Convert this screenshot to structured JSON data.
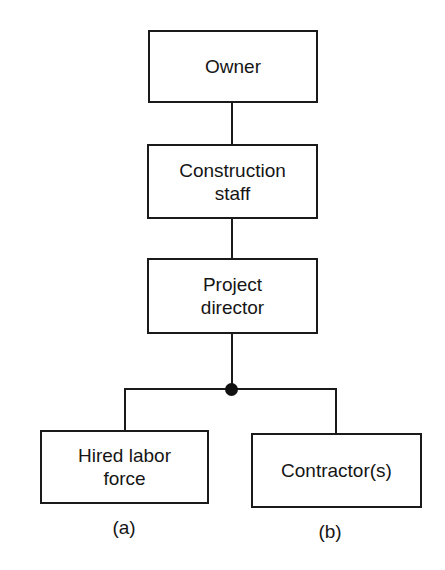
{
  "diagram": {
    "type": "organization-chart",
    "nodes": [
      {
        "id": "owner",
        "label": "Owner"
      },
      {
        "id": "construction-staff",
        "label": "Construction\nstaff"
      },
      {
        "id": "project-director",
        "label": "Project\ndirector"
      },
      {
        "id": "hired-labor-force",
        "label": "Hired labor\nforce",
        "caption": "(a)"
      },
      {
        "id": "contractors",
        "label": "Contractor(s)",
        "caption": "(b)"
      }
    ],
    "edges": [
      [
        "owner",
        "construction-staff"
      ],
      [
        "construction-staff",
        "project-director"
      ],
      [
        "project-director",
        "hired-labor-force"
      ],
      [
        "project-director",
        "contractors"
      ]
    ]
  },
  "labels": {
    "owner": "Owner",
    "construction_staff_1": "Construction",
    "construction_staff_2": "staff",
    "project_director_1": "Project",
    "project_director_2": "director",
    "hired_labor_1": "Hired labor",
    "hired_labor_2": "force",
    "contractors": "Contractor(s)",
    "caption_a": "(a)",
    "caption_b": "(b)"
  }
}
